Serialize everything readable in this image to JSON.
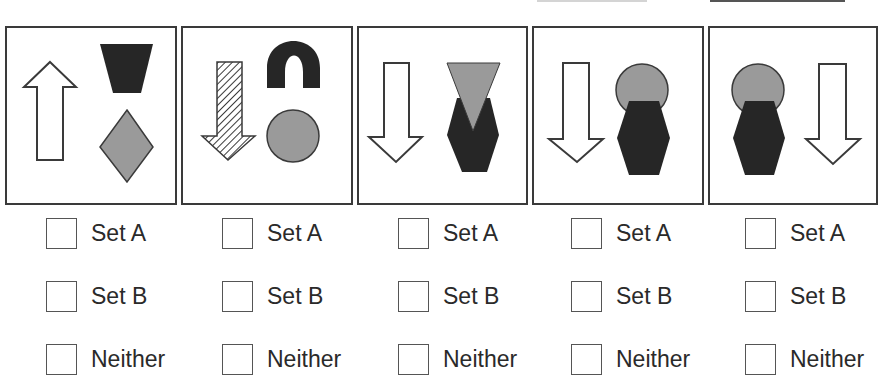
{
  "colors": {
    "outline": "#3a3a3a",
    "dark_fill": "#262626",
    "gray_fill": "#9a9a9a",
    "white_fill": "#ffffff",
    "text": "#2a2a2a"
  },
  "panels": [
    {
      "index": 1,
      "shapes": [
        {
          "type": "arrow",
          "direction": "up",
          "fill": "white"
        },
        {
          "type": "trapezoid",
          "orientation": "wide-top",
          "fill": "black"
        },
        {
          "type": "diamond",
          "fill": "gray"
        }
      ]
    },
    {
      "index": 2,
      "shapes": [
        {
          "type": "arrow",
          "direction": "down",
          "fill": "hatched"
        },
        {
          "type": "arch",
          "fill": "black"
        },
        {
          "type": "circle",
          "fill": "gray"
        }
      ]
    },
    {
      "index": 3,
      "shapes": [
        {
          "type": "arrow",
          "direction": "down",
          "fill": "white"
        },
        {
          "type": "triangle",
          "orientation": "point-down",
          "fill": "gray"
        },
        {
          "type": "hexagon",
          "fill": "black"
        }
      ]
    },
    {
      "index": 4,
      "shapes": [
        {
          "type": "arrow",
          "direction": "down",
          "fill": "white"
        },
        {
          "type": "circle",
          "fill": "gray"
        },
        {
          "type": "hexagon",
          "fill": "black"
        }
      ]
    },
    {
      "index": 5,
      "shapes": [
        {
          "type": "circle",
          "fill": "gray"
        },
        {
          "type": "hexagon",
          "fill": "black"
        },
        {
          "type": "arrow",
          "direction": "down",
          "fill": "white"
        }
      ]
    }
  ],
  "options": {
    "set_a": "Set A",
    "set_b": "Set B",
    "neither": "Neither"
  },
  "answers": [
    {
      "panel": 1,
      "set_a": false,
      "set_b": false,
      "neither": false
    },
    {
      "panel": 2,
      "set_a": false,
      "set_b": false,
      "neither": false
    },
    {
      "panel": 3,
      "set_a": false,
      "set_b": false,
      "neither": false
    },
    {
      "panel": 4,
      "set_a": false,
      "set_b": false,
      "neither": false
    },
    {
      "panel": 5,
      "set_a": false,
      "set_b": false,
      "neither": false
    }
  ]
}
